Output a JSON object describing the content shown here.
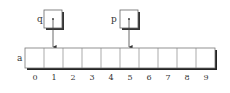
{
  "diagram": {
    "array": {
      "name": "a",
      "indices": [
        "0",
        "1",
        "2",
        "3",
        "4",
        "5",
        "6",
        "7",
        "8",
        "9"
      ]
    },
    "pointers": [
      {
        "name": "q",
        "points_to_index": 1
      },
      {
        "name": "p",
        "points_to_index": 5
      }
    ],
    "colors": {
      "line": "#555555",
      "shadow": "#222222",
      "background": "#ffffff"
    }
  }
}
